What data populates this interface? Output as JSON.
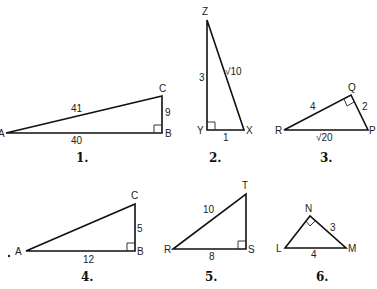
{
  "triangles": [
    {
      "number": "1.",
      "vertices": {
        "A": "A",
        "B": "B",
        "C": "C"
      },
      "right_angle_at": "B",
      "sides": {
        "hypotenuse_AC": "41",
        "leg_AB": "40",
        "leg_BC": "9"
      }
    },
    {
      "number": "2.",
      "vertices": {
        "Z": "Z",
        "Y": "Y",
        "X": "X"
      },
      "right_angle_at": "Y",
      "sides": {
        "leg_ZY": "3",
        "hypotenuse_ZX": "√10",
        "leg_YX": "1"
      }
    },
    {
      "number": "3.",
      "vertices": {
        "R": "R",
        "Q": "Q",
        "P": "P"
      },
      "right_angle_at": "Q",
      "sides": {
        "leg_RQ": "4",
        "leg_QP": "2",
        "hypotenuse_RP": "√20"
      }
    },
    {
      "number": "4.",
      "vertices": {
        "A": "A",
        "B": "B",
        "C": "C"
      },
      "right_angle_at": "B",
      "sides": {
        "leg_AB": "12",
        "leg_BC": "5"
      }
    },
    {
      "number": "5.",
      "vertices": {
        "R": "R",
        "S": "S",
        "T": "T"
      },
      "right_angle_at": "S",
      "sides": {
        "hypotenuse_RT": "10",
        "leg_RS": "8"
      }
    },
    {
      "number": "6.",
      "vertices": {
        "L": "L",
        "N": "N",
        "M": "M"
      },
      "right_angle_at": "N",
      "sides": {
        "leg_NM": "3",
        "hypotenuse_LM": "4"
      }
    }
  ]
}
